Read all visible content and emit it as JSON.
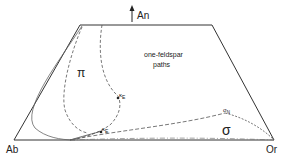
{
  "labels": {
    "apex": "An",
    "left_corner": "Ab",
    "right_corner": "Or",
    "region_text_line1": "one-feldspar",
    "region_text_line2": "paths",
    "pi_symbol": "π",
    "sigma_symbol": "σ",
    "kappa_upper": "κ",
    "kappa_upper_sub": "E",
    "kappa_lower": "κ",
    "kappa_lower_sub": "E",
    "sigma_point": "σ",
    "sigma_point_sub": "N"
  },
  "colors": {
    "line": "#333333",
    "dash": "#555555"
  }
}
